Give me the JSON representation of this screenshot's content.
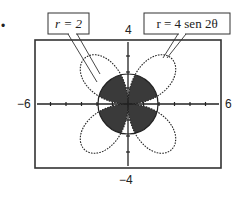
{
  "figure": {
    "bullet": "•",
    "window": {
      "xmin": -6,
      "xmax": 6,
      "ymin": -4,
      "ymax": 4,
      "xscl": 1,
      "yscl": 1
    },
    "axis_labels": {
      "xmin_label": "−6",
      "xmax_label": "6",
      "ymax_label": "4",
      "ymin_label": "−4"
    },
    "callouts": [
      {
        "id": "circle",
        "text": "r = 2"
      },
      {
        "id": "rose",
        "text": "r = 4 sen 2θ"
      }
    ],
    "curves": [
      {
        "name": "circle",
        "equation": "r = 2",
        "style": "solid"
      },
      {
        "name": "four-petal-rose",
        "equation": "r = 4 sen 2θ",
        "style": "dotted"
      }
    ],
    "shaded_region": "inside both r = 2 and r = 4 sen 2θ",
    "colors": {
      "shade": "#3a3a3a",
      "line": "#222222",
      "frame": "#333333",
      "background": "#ffffff"
    }
  }
}
